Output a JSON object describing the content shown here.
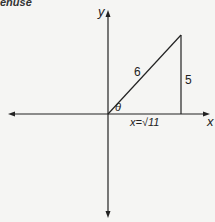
{
  "header": {
    "cropped_text": "enuse"
  },
  "axes": {
    "x_label": "x",
    "y_label": "y"
  },
  "triangle": {
    "hypotenuse_label": "6",
    "opposite_label": "5",
    "angle_label": "θ",
    "adjacent_label": "x=√11"
  },
  "colors": {
    "line": "#222222",
    "background": "#f5f5f3"
  }
}
